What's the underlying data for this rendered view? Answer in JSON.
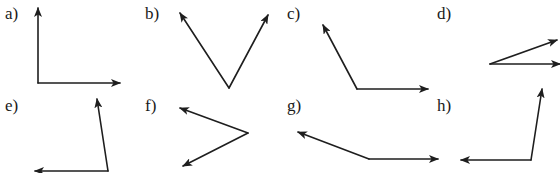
{
  "figure": {
    "stroke_color": "#1e1e1e",
    "background": "#ffffff",
    "top_text_cutoff": true
  },
  "panels": [
    {
      "label": "a)",
      "label_pos": [
        5,
        5
      ],
      "vertex": [
        38,
        83
      ],
      "rays": [
        [
          38,
          8
        ],
        [
          120,
          83
        ]
      ],
      "angle_type": "right"
    },
    {
      "label": "b)",
      "label_pos": [
        145,
        5
      ],
      "vertex": [
        229,
        88
      ],
      "rays": [
        [
          180,
          13
        ],
        [
          268,
          15
        ]
      ],
      "angle_type": "acute"
    },
    {
      "label": "c)",
      "label_pos": [
        287,
        5
      ],
      "vertex": [
        357,
        89
      ],
      "rays": [
        [
          323,
          25
        ],
        [
          428,
          89
        ]
      ],
      "angle_type": "obtuse"
    },
    {
      "label": "d)",
      "label_pos": [
        437,
        5
      ],
      "vertex": [
        490,
        64
      ],
      "rays": [
        [
          557,
          40
        ],
        [
          560,
          64
        ]
      ],
      "angle_type": "acute"
    },
    {
      "label": "e)",
      "label_pos": [
        5,
        97
      ],
      "vertex": [
        108,
        171
      ],
      "rays": [
        [
          97,
          99
        ],
        [
          35,
          171
        ]
      ],
      "angle_type": "acute"
    },
    {
      "label": "f)",
      "label_pos": [
        145,
        97
      ],
      "vertex": [
        248,
        133
      ],
      "rays": [
        [
          180,
          108
        ],
        [
          183,
          166
        ]
      ],
      "angle_type": "acute"
    },
    {
      "label": "g)",
      "label_pos": [
        287,
        97
      ],
      "vertex": [
        369,
        159
      ],
      "rays": [
        [
          298,
          132
        ],
        [
          438,
          159
        ]
      ],
      "angle_type": "obtuse"
    },
    {
      "label": "h)",
      "label_pos": [
        437,
        97
      ],
      "vertex": [
        531,
        160
      ],
      "rays": [
        [
          542,
          89
        ],
        [
          461,
          160
        ]
      ],
      "angle_type": "acute"
    }
  ]
}
